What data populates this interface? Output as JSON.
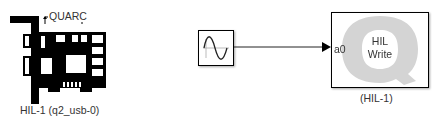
{
  "diagram": {
    "hil_initialize_block": {
      "icon": "quarc-pci-card-icon",
      "brand_label": "QUARC",
      "caption": "HIL-1 (q2_usb-0)"
    },
    "sine_wave_block": {
      "icon": "sine-wave-icon"
    },
    "signal_line": {
      "from": "sine-wave-block",
      "to": "hil-write-block.a0"
    },
    "hil_write_block": {
      "title_line1": "HIL",
      "title_line2": "Write",
      "input_port_label": "a0",
      "caption": "(HIL-1)",
      "watermark_icon": "quanser-q-logo-icon"
    }
  },
  "colors": {
    "block_border": "#000000",
    "card_fill": "#000000",
    "q_watermark": "#d0d0d0",
    "text": "#333333"
  }
}
